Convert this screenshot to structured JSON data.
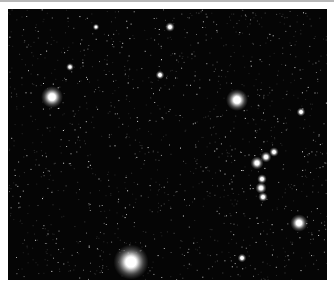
{
  "image": {
    "subject": "star field",
    "background_color": "#050505",
    "frame": {
      "x": 8,
      "y": 9,
      "width": 319,
      "height": 271
    },
    "bright_stars": [
      {
        "x": 44,
        "y": 88,
        "r": 5
      },
      {
        "x": 229,
        "y": 91,
        "r": 5
      },
      {
        "x": 123,
        "y": 253,
        "r": 8
      },
      {
        "x": 291,
        "y": 214,
        "r": 4
      },
      {
        "x": 162,
        "y": 18,
        "r": 2.2
      },
      {
        "x": 293,
        "y": 103,
        "r": 2
      },
      {
        "x": 152,
        "y": 66,
        "r": 2
      },
      {
        "x": 249,
        "y": 154,
        "r": 3
      },
      {
        "x": 258,
        "y": 148,
        "r": 2.5
      },
      {
        "x": 266,
        "y": 143,
        "r": 2.2
      },
      {
        "x": 254,
        "y": 170,
        "r": 2.2
      },
      {
        "x": 253,
        "y": 179,
        "r": 2.6
      },
      {
        "x": 255,
        "y": 188,
        "r": 2.2
      },
      {
        "x": 234,
        "y": 249,
        "r": 2
      },
      {
        "x": 62,
        "y": 58,
        "r": 1.8
      },
      {
        "x": 88,
        "y": 18,
        "r": 1.5
      }
    ]
  }
}
